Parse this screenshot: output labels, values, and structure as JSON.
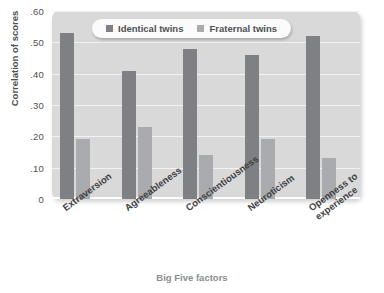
{
  "chart_data": {
    "type": "bar",
    "title": "",
    "xlabel": "Big Five factors",
    "ylabel": "Correlation of scores",
    "categories": [
      "Extraversion",
      "Agreeableness",
      "Conscientiousness",
      "Neuroticism",
      "Openness to experience"
    ],
    "category_lines": [
      [
        "Extraversion"
      ],
      [
        "Agreeableness"
      ],
      [
        "Conscientiousness"
      ],
      [
        "Neuroticism"
      ],
      [
        "Openness to",
        "experience"
      ]
    ],
    "series": [
      {
        "name": "Identical twins",
        "color": "#7e8083",
        "values": [
          0.53,
          0.41,
          0.48,
          0.46,
          0.52
        ]
      },
      {
        "name": "Fraternal twins",
        "color": "#a9abae",
        "values": [
          0.19,
          0.23,
          0.14,
          0.19,
          0.13
        ]
      }
    ],
    "ylim": [
      0,
      0.6
    ],
    "yticks": [
      0,
      0.1,
      0.2,
      0.3,
      0.4,
      0.5,
      0.6
    ],
    "ytick_labels": [
      "0",
      ".10",
      ".20",
      ".30",
      ".40",
      ".50",
      ".60"
    ],
    "grid": true,
    "legend_position": "top-center",
    "plot_background": "#d9d9d9",
    "gridline_color": "#f2f2f2",
    "page_background": "#ffffff"
  }
}
